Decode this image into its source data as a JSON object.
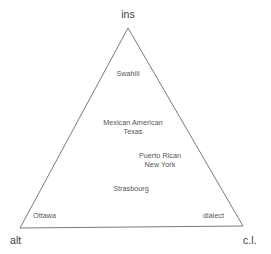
{
  "diagram": {
    "type": "ternary-triangle",
    "background_color": "#ffffff",
    "line_color": "#7a7a7a",
    "corner_label_color": "#3d3d3d",
    "item_label_color": "#555555",
    "corners": {
      "top": "ins",
      "bottom_left": "alt",
      "bottom_right": "c.l."
    },
    "items": [
      {
        "lines": [
          "Swahili"
        ]
      },
      {
        "lines": [
          "Mexican American",
          "Texas"
        ]
      },
      {
        "lines": [
          "Puerto Rican",
          "New York"
        ]
      },
      {
        "lines": [
          "Strasbourg"
        ]
      },
      {
        "lines": [
          "Ottawa"
        ]
      },
      {
        "lines": [
          "dialect"
        ]
      }
    ],
    "item_lines": {
      "swahili": "Swahili",
      "mexican_american": "Mexican American",
      "texas": "Texas",
      "puerto_rican": "Puerto Rican",
      "new_york": "New York",
      "strasbourg": "Strasbourg",
      "ottawa": "Ottawa",
      "dialect": "dialect"
    }
  }
}
